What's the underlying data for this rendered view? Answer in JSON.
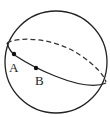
{
  "diagram": {
    "type": "sphere-with-great-circle",
    "colors": {
      "stroke": "#222222",
      "background": "#ffffff"
    },
    "sphere": {
      "cx": 56,
      "cy": 62,
      "r": 51
    },
    "great_circle": {
      "front_arc": "solid",
      "back_arc": "dashed"
    },
    "points": [
      {
        "label": "A",
        "x": 14,
        "y": 54
      },
      {
        "label": "B",
        "x": 36,
        "y": 68
      }
    ]
  }
}
